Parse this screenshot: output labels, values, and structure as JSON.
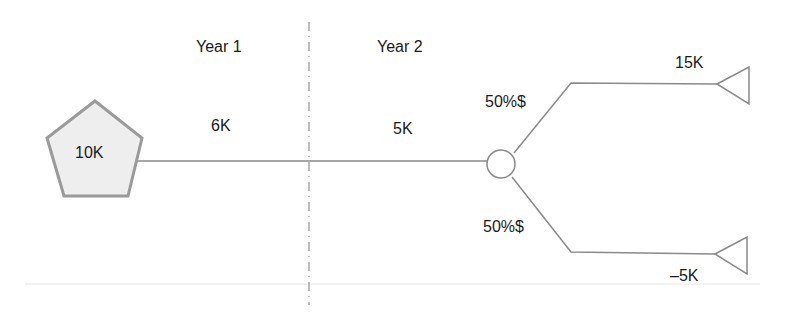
{
  "diagram": {
    "type": "decision-tree",
    "periods": [
      {
        "label": "Year 1",
        "cash_flow": "6K"
      },
      {
        "label": "Year 2",
        "cash_flow": "5K"
      }
    ],
    "root": {
      "shape": "pentagon",
      "label": "10K"
    },
    "chance_node": {
      "shape": "circle"
    },
    "branches": [
      {
        "probability": "50%$",
        "outcome": "15K",
        "terminal": "triangle"
      },
      {
        "probability": "50%$",
        "outcome": "–5K",
        "terminal": "triangle"
      }
    ]
  },
  "colors": {
    "line": "#8a8a8a",
    "pentagon_fill": "#eeeeee",
    "pentagon_stroke": "#999999",
    "text": "#1a1a1a"
  }
}
